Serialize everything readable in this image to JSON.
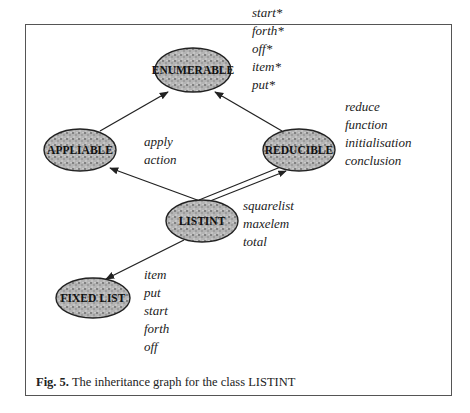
{
  "figure": {
    "caption_label": "Fig. 5.",
    "caption_text": " The inheritance graph for the class LISTINT"
  },
  "nodes": [
    {
      "id": "enumerable",
      "label": "ENUMERABLE",
      "features": [
        "start*",
        "forth*",
        "off*",
        "item*",
        "put*"
      ]
    },
    {
      "id": "appliable",
      "label": "APPLIABLE",
      "features": [
        "apply",
        "action"
      ]
    },
    {
      "id": "reducible",
      "label": "REDUCIBLE",
      "features": [
        "reduce",
        "function",
        "initialisation",
        "conclusion"
      ]
    },
    {
      "id": "listint",
      "label": "LISTINT",
      "features": [
        "squarelist",
        "maxelem",
        "total"
      ]
    },
    {
      "id": "fixed_list",
      "label": "FIXED LIST",
      "features": [
        "item",
        "put",
        "start",
        "forth",
        "off"
      ]
    }
  ],
  "edges": [
    {
      "from": "appliable",
      "to": "enumerable",
      "style": "single"
    },
    {
      "from": "reducible",
      "to": "enumerable",
      "style": "single"
    },
    {
      "from": "listint",
      "to": "appliable",
      "style": "single"
    },
    {
      "from": "listint",
      "to": "reducible",
      "style": "double"
    },
    {
      "from": "listint",
      "to": "fixed_list",
      "style": "single"
    }
  ]
}
